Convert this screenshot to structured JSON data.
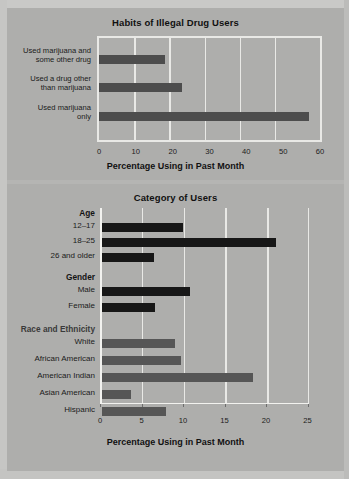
{
  "page": {
    "background_color": "#b5b5b3",
    "panel_color": "#aeaeac",
    "grid_color": "#e9e9e6"
  },
  "chart_data": [
    {
      "type": "bar",
      "orientation": "horizontal",
      "title": "Habits of Illegal Drug Users",
      "xlabel": "Percentage Using in Past Month",
      "ylabel": "",
      "xlim": [
        0,
        60
      ],
      "xticks": [
        0,
        10,
        20,
        30,
        40,
        50,
        60
      ],
      "grid": true,
      "bar_color": "#4d4d4d",
      "categories": [
        "Used marijuana and\nsome other drug",
        "Used a drug other\nthan marijuana",
        "Used marijuana\nonly"
      ],
      "values": [
        18.0,
        22.5,
        57.0
      ]
    },
    {
      "type": "bar",
      "orientation": "horizontal",
      "title": "Category of Users",
      "xlabel": "Percentage Using in Past Month",
      "ylabel": "",
      "xlim": [
        0,
        25
      ],
      "xticks": [
        0,
        5,
        10,
        15,
        20,
        25
      ],
      "grid": true,
      "groups": [
        {
          "name": "Age",
          "bar_color": "#171717",
          "categories": [
            "12–17",
            "18–25",
            "26 and older"
          ],
          "values": [
            9.8,
            21.0,
            6.3
          ]
        },
        {
          "name": "Gender",
          "bar_color": "#171717",
          "categories": [
            "Male",
            "Female"
          ],
          "values": [
            10.7,
            6.5
          ]
        },
        {
          "name": "Race and Ethnicity",
          "bar_color": "#565656",
          "categories": [
            "White",
            "African American",
            "American Indian",
            "Asian American",
            "Hispanic"
          ],
          "values": [
            8.8,
            9.6,
            18.3,
            3.5,
            7.8
          ]
        }
      ]
    }
  ],
  "chart1": {
    "title": "Habits of Illegal Drug Users",
    "xtitle": "Percentage Using in Past Month",
    "ticks": [
      "0",
      "10",
      "20",
      "30",
      "40",
      "50",
      "60"
    ],
    "labels": [
      "Used marijuana and\nsome other drug",
      "Used a drug other\nthan marijuana",
      "Used marijuana\nonly"
    ]
  },
  "chart2": {
    "title": "Category of Users",
    "xtitle": "Percentage Using in Past Month",
    "ticks": [
      "0",
      "5",
      "10",
      "15",
      "20",
      "25"
    ],
    "group_age": "Age",
    "group_gender": "Gender",
    "group_race": "Race and Ethnicity",
    "labels": [
      "12–17",
      "18–25",
      "26 and older",
      "Male",
      "Female",
      "White",
      "African American",
      "American Indian",
      "Asian American",
      "Hispanic"
    ]
  }
}
